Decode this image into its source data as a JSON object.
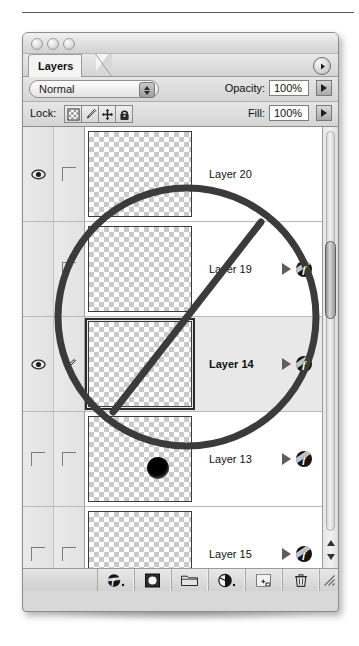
{
  "window": {
    "title_controls": [
      "close",
      "minimize",
      "zoom"
    ],
    "panel_tab": "Layers",
    "palette_menu_icon": "palette-menu-triangle-icon"
  },
  "options": {
    "blend_mode": "Normal",
    "blend_mode_stepper_icon": "updown-stepper-icon",
    "opacity_label": "Opacity:",
    "opacity_value": "100%",
    "fill_label": "Fill:",
    "fill_value": "100%",
    "lock_label": "Lock:",
    "lock_buttons": [
      {
        "name": "lock-transparent-pixels",
        "icon": "checkerboard-square-icon"
      },
      {
        "name": "lock-image-pixels",
        "icon": "paintbrush-icon"
      },
      {
        "name": "lock-position",
        "icon": "move-arrows-icon"
      },
      {
        "name": "lock-all",
        "icon": "padlock-icon"
      }
    ]
  },
  "layers": [
    {
      "name": "Layer 20",
      "visible": true,
      "linked": false,
      "selected": false,
      "has_effects": false,
      "thumb_blob": false
    },
    {
      "name": "Layer 19",
      "visible": false,
      "linked": false,
      "selected": false,
      "has_effects": true,
      "thumb_blob": false
    },
    {
      "name": "Layer 14",
      "visible": true,
      "linked": true,
      "selected": true,
      "has_effects": true,
      "thumb_blob": false
    },
    {
      "name": "Layer 13",
      "visible": false,
      "linked": false,
      "selected": false,
      "has_effects": true,
      "thumb_blob": true
    },
    {
      "name": "Layer 15",
      "visible": false,
      "linked": false,
      "selected": false,
      "has_effects": true,
      "thumb_blob": false
    }
  ],
  "scrollbar": {
    "up_icon": "scroll-up-arrow-icon",
    "down_icon": "scroll-down-arrow-icon"
  },
  "toolbar": [
    {
      "name": "add-layer-style-button",
      "icon": "fx-circle-icon"
    },
    {
      "name": "add-layer-mask-button",
      "icon": "mask-square-icon"
    },
    {
      "name": "new-group-button",
      "icon": "folder-icon"
    },
    {
      "name": "new-adjustment-layer-button",
      "icon": "half-filled-circle-icon"
    },
    {
      "name": "new-layer-button",
      "icon": "new-page-icon"
    },
    {
      "name": "delete-layer-button",
      "icon": "trash-icon"
    }
  ],
  "annotation": {
    "type": "prohibition-sign",
    "color": "#3b3b3b",
    "cx": 187,
    "cy": 317,
    "r": 129,
    "stroke": 7,
    "slash_x1": 113,
    "slash_y1": 412,
    "slash_x2": 261,
    "slash_y2": 222
  }
}
